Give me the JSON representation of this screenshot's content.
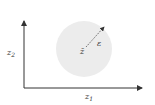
{
  "diagram": {
    "axes": {
      "x_label": "z",
      "x_sub": "1",
      "y_label": "z",
      "y_sub": "2"
    },
    "region": {
      "center_label": "z̄",
      "radius_label": "ε",
      "fill_color": "#ececec"
    },
    "colors": {
      "axis": "#333333",
      "arrow": "#555555"
    }
  }
}
